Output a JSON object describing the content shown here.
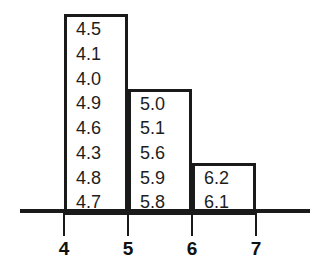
{
  "chart_data": {
    "type": "bar",
    "title": "",
    "subtitle": "",
    "xlabel": "",
    "ylabel": "",
    "grid": false,
    "legend": false,
    "xlim": [
      3.5,
      7.5
    ],
    "x_tick_labels": [
      "4",
      "5",
      "6",
      "7"
    ],
    "bin_edges": [
      4,
      5,
      6,
      7
    ],
    "categories": [
      "4-5",
      "5-6",
      "6-7"
    ],
    "values": [
      8,
      5,
      2
    ],
    "bins": [
      {
        "range_label": "4-5",
        "left_edge": "4",
        "right_edge": "5",
        "count": 8,
        "data_labels": [
          "4.5",
          "4.1",
          "4.0",
          "4.9",
          "4.6",
          "4.3",
          "4.8",
          "4.7"
        ]
      },
      {
        "range_label": "5-6",
        "left_edge": "5",
        "right_edge": "6",
        "count": 5,
        "data_labels": [
          "5.0",
          "5.1",
          "5.6",
          "5.9",
          "5.8"
        ]
      },
      {
        "range_label": "6-7",
        "left_edge": "6",
        "right_edge": "7",
        "count": 2,
        "data_labels": [
          "6.2",
          "6.1"
        ]
      }
    ],
    "colors": {
      "bar_fill": "#ffffff",
      "bar_stroke": "#1a1a1a",
      "axis": "#1a1a1a",
      "text": "#1d1d1d"
    }
  }
}
